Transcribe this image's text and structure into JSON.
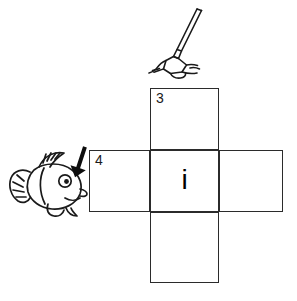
{
  "worksheet": {
    "type": "picture-clue-crossword",
    "grid": {
      "shape": "plus",
      "cells": [
        {
          "id": "top",
          "number": "3",
          "letter": "",
          "position": "top"
        },
        {
          "id": "left",
          "number": "4",
          "letter": "",
          "position": "left"
        },
        {
          "id": "center",
          "number": "",
          "letter": "i",
          "position": "center"
        },
        {
          "id": "right",
          "number": "",
          "letter": "",
          "position": "right"
        },
        {
          "id": "bottom",
          "number": "",
          "letter": "",
          "position": "bottom"
        }
      ]
    },
    "clues": [
      {
        "number": "3",
        "direction": "down",
        "icon": "shovel-digging-icon",
        "description": "shovel digging into ground"
      },
      {
        "number": "4",
        "direction": "across",
        "icon": "fish-with-fin-arrow-icon",
        "description": "fish with arrow pointing to dorsal fin"
      }
    ],
    "colors": {
      "grid_line": "#2b2b2b",
      "text": "#1a1a1a",
      "ink": "#000000",
      "background": "#ffffff"
    }
  }
}
